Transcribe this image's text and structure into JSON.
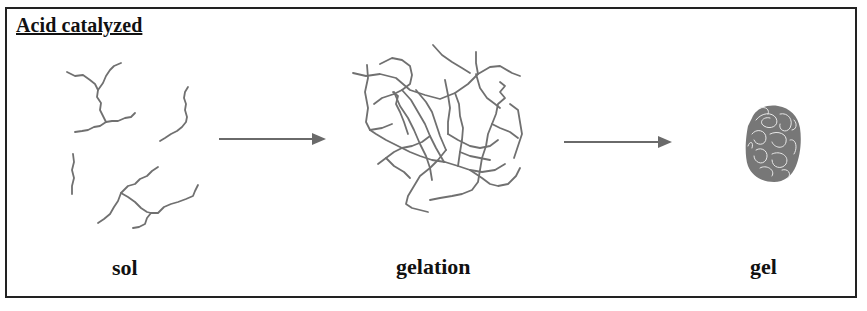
{
  "diagram": {
    "title": "Acid catalyzed",
    "stages": [
      {
        "label": "sol",
        "description": "isolated weakly branched polymer chains"
      },
      {
        "label": "gelation",
        "description": "interconnected branched network"
      },
      {
        "label": "gel",
        "description": "dense entangled cluster"
      }
    ],
    "arrows": [
      {
        "from": "sol",
        "to": "gelation"
      },
      {
        "from": "gelation",
        "to": "gel"
      }
    ],
    "colors": {
      "strand": "#707070",
      "arrow": "#6a6a6a",
      "border": "#222222",
      "text": "#111111"
    }
  }
}
